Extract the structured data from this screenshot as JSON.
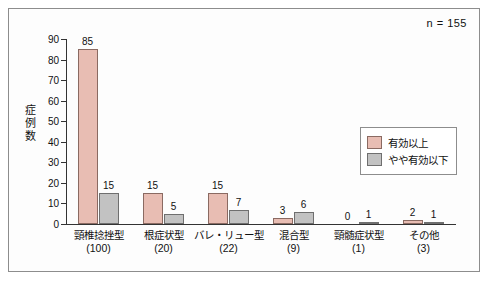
{
  "note": "n = 155",
  "chart_data": {
    "type": "bar",
    "title": "",
    "xlabel": "",
    "ylabel": "症例数",
    "ylim": [
      0,
      90
    ],
    "yticks": [
      "0",
      "10",
      "20",
      "30",
      "40",
      "50",
      "60",
      "70",
      "80",
      "90"
    ],
    "grid": false,
    "legend_position": "right-middle",
    "categories": [
      {
        "label": "頸椎捻挫型",
        "sub": "(100)"
      },
      {
        "label": "根症状型",
        "sub": "(20)"
      },
      {
        "label": "バレ・リュー型",
        "sub": "(22)"
      },
      {
        "label": "混合型",
        "sub": "(9)"
      },
      {
        "label": "頸髄症状型",
        "sub": "(1)"
      },
      {
        "label": "その他",
        "sub": "(3)"
      }
    ],
    "series": [
      {
        "name": "有効以上",
        "color": "#e8bdb3",
        "values": [
          85,
          15,
          15,
          3,
          0,
          2
        ]
      },
      {
        "name": "やや有効以下",
        "color": "#c2c2c2",
        "values": [
          15,
          5,
          7,
          6,
          1,
          1
        ]
      }
    ]
  }
}
